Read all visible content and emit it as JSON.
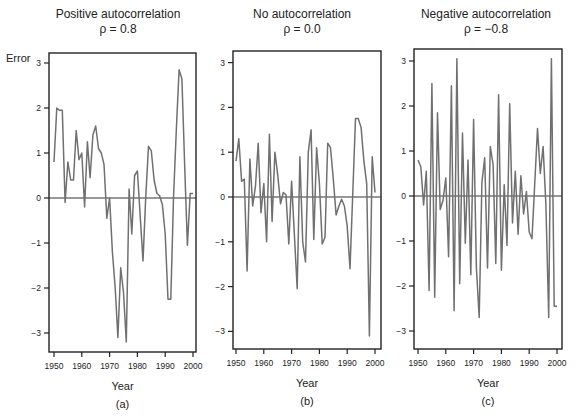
{
  "figure": {
    "y_axis_label": "Error",
    "panels": [
      {
        "id": "a",
        "title": "Positive autocorrelation",
        "rho_label": "ρ =  0.8",
        "xlabel": "Year",
        "caption": "(a)"
      },
      {
        "id": "b",
        "title": "No autocorrelation",
        "rho_label": "ρ =  0.0",
        "xlabel": "Year",
        "caption": "(b)"
      },
      {
        "id": "c",
        "title": "Negative autocorrelation",
        "rho_label": "ρ = −0.8",
        "xlabel": "Year",
        "caption": "(c)"
      }
    ],
    "x_ticks": [
      "1950",
      "1960",
      "1970",
      "1980",
      "1990",
      "2000"
    ],
    "y_ticks": [
      "3",
      "2",
      "1",
      "0",
      "−1",
      "−2",
      "−3"
    ],
    "line_color": "#707070"
  },
  "chart_data": [
    {
      "type": "line",
      "title": "Positive autocorrelation ρ = 0.8",
      "xlabel": "Year",
      "ylabel": "Error",
      "xlim": [
        1950,
        2000
      ],
      "ylim": [
        -3.4,
        3.3
      ],
      "grid": false,
      "reference_line": 0,
      "x": [
        1950,
        1951,
        1952,
        1953,
        1954,
        1955,
        1956,
        1957,
        1958,
        1959,
        1960,
        1961,
        1962,
        1963,
        1964,
        1965,
        1966,
        1967,
        1968,
        1969,
        1970,
        1971,
        1972,
        1973,
        1974,
        1975,
        1976,
        1977,
        1978,
        1979,
        1980,
        1981,
        1982,
        1983,
        1984,
        1985,
        1986,
        1987,
        1988,
        1989,
        1990,
        1991,
        1992,
        1993,
        1994,
        1995,
        1996,
        1997,
        1998,
        1999,
        2000
      ],
      "series": [
        {
          "name": "error",
          "values": [
            0.8,
            2.0,
            1.95,
            1.95,
            -0.1,
            0.8,
            0.4,
            0.4,
            1.5,
            0.85,
            1.0,
            -0.2,
            1.25,
            0.45,
            1.4,
            1.6,
            1.1,
            1.0,
            0.75,
            -0.45,
            0.0,
            -1.2,
            -2.0,
            -3.1,
            -1.55,
            -2.1,
            -3.2,
            0.2,
            -0.8,
            0.5,
            0.6,
            -0.4,
            -1.4,
            0.0,
            1.15,
            1.05,
            0.4,
            0.1,
            0.05,
            -0.15,
            -0.8,
            -2.25,
            -2.25,
            0.0,
            1.5,
            2.85,
            2.65,
            0.7,
            -1.05,
            0.1,
            0.1
          ]
        }
      ]
    },
    {
      "type": "line",
      "title": "No autocorrelation ρ = 0.0",
      "xlabel": "Year",
      "ylabel": "Error",
      "xlim": [
        1950,
        2000
      ],
      "ylim": [
        -3.4,
        3.3
      ],
      "grid": false,
      "reference_line": 0,
      "x": [
        1950,
        1951,
        1952,
        1953,
        1954,
        1955,
        1956,
        1957,
        1958,
        1959,
        1960,
        1961,
        1962,
        1963,
        1964,
        1965,
        1966,
        1967,
        1968,
        1969,
        1970,
        1971,
        1972,
        1973,
        1974,
        1975,
        1976,
        1977,
        1978,
        1979,
        1980,
        1981,
        1982,
        1983,
        1984,
        1985,
        1986,
        1987,
        1988,
        1989,
        1990,
        1991,
        1992,
        1993,
        1994,
        1995,
        1996,
        1997,
        1998,
        1999,
        2000
      ],
      "series": [
        {
          "name": "error",
          "values": [
            0.8,
            1.3,
            0.35,
            0.4,
            -1.65,
            0.85,
            -0.2,
            0.25,
            1.2,
            -0.35,
            0.3,
            -1.0,
            1.4,
            -0.55,
            1.0,
            0.5,
            -0.15,
            0.1,
            0.05,
            -1.05,
            0.35,
            -0.85,
            -2.05,
            0.9,
            -1.0,
            -1.45,
            1.0,
            1.5,
            -0.95,
            1.1,
            0.3,
            -1.05,
            -0.9,
            1.2,
            1.1,
            0.4,
            -0.4,
            -0.2,
            -0.05,
            -0.2,
            -0.65,
            -1.6,
            0.1,
            1.75,
            1.75,
            1.55,
            0.8,
            0.3,
            -3.1,
            0.9,
            0.1
          ]
        }
      ]
    },
    {
      "type": "line",
      "title": "Negative autocorrelation ρ = −0.8",
      "xlabel": "Year",
      "ylabel": "Error",
      "xlim": [
        1950,
        2000
      ],
      "ylim": [
        -3.4,
        3.3
      ],
      "grid": false,
      "reference_line": 0,
      "x": [
        1950,
        1951,
        1952,
        1953,
        1954,
        1955,
        1956,
        1957,
        1958,
        1959,
        1960,
        1961,
        1962,
        1963,
        1964,
        1965,
        1966,
        1967,
        1968,
        1969,
        1970,
        1971,
        1972,
        1973,
        1974,
        1975,
        1976,
        1977,
        1978,
        1979,
        1980,
        1981,
        1982,
        1983,
        1984,
        1985,
        1986,
        1987,
        1988,
        1989,
        1990,
        1991,
        1992,
        1993,
        1994,
        1995,
        1996,
        1997,
        1998,
        1999,
        2000
      ],
      "series": [
        {
          "name": "error",
          "values": [
            0.8,
            0.65,
            -0.2,
            0.55,
            -2.1,
            2.5,
            -2.25,
            1.85,
            -0.3,
            -0.1,
            0.4,
            -1.35,
            2.45,
            -2.55,
            3.05,
            -1.95,
            1.4,
            -1.05,
            0.8,
            -1.75,
            1.7,
            -1.6,
            -2.7,
            0.3,
            0.85,
            -1.6,
            1.1,
            0.7,
            -1.5,
            2.25,
            -1.65,
            0.25,
            -1.1,
            2.05,
            -0.6,
            0.55,
            -0.85,
            0.45,
            -0.4,
            0.1,
            -0.8,
            -0.95,
            0.3,
            1.5,
            0.5,
            1.1,
            -0.2,
            -2.7,
            3.05,
            -2.45,
            -2.45
          ]
        }
      ]
    }
  ]
}
